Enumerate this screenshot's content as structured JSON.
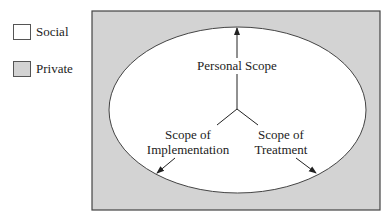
{
  "legend": {
    "items": [
      {
        "label": "Social",
        "color": "#ffffff"
      },
      {
        "label": "Private",
        "color": "#d3d3d3"
      }
    ]
  },
  "diagram": {
    "outer_region": {
      "name": "Private",
      "fill": "#d3d3d3"
    },
    "inner_region": {
      "name": "Social",
      "fill": "#ffffff"
    },
    "labels": {
      "personal_scope": "Personal Scope",
      "implementation_line1": "Scope of",
      "implementation_line2": "Implementation",
      "treatment_line1": "Scope of",
      "treatment_line2": "Treatment"
    },
    "arrows": [
      {
        "name": "Personal Scope",
        "direction": "up"
      },
      {
        "name": "Scope of Implementation",
        "direction": "down-left"
      },
      {
        "name": "Scope of Treatment",
        "direction": "down-right"
      }
    ]
  }
}
